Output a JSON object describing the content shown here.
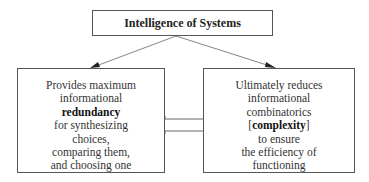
{
  "title": "Intelligence of Systems",
  "left_box": {
    "lines": [
      {
        "text": "Provides maximum",
        "bold": false
      },
      {
        "text": "informational",
        "bold": false
      },
      {
        "text": "redundancy",
        "bold": true
      },
      {
        "text": "for synthesizing",
        "bold": false
      },
      {
        "text": "choices,",
        "bold": false
      },
      {
        "text": "comparing them,",
        "bold": false
      },
      {
        "text": "and choosing one",
        "bold": false
      }
    ]
  },
  "right_box": {
    "lines": [
      {
        "text": "Ultimately reduces",
        "bold": false
      },
      {
        "text": "informational",
        "bold": false
      },
      {
        "text": "combinatorics",
        "bold": false
      },
      {
        "pre": "[",
        "text": "complexity",
        "post": "]",
        "bold": true
      },
      {
        "text": "to ensure",
        "bold": false
      },
      {
        "text": "the efficiency of",
        "bold": false
      },
      {
        "text": "functioning",
        "bold": false
      }
    ]
  },
  "connectors": {
    "top_to_left": "arrow",
    "top_to_right": "arrow",
    "left_right": "double-arrow"
  }
}
